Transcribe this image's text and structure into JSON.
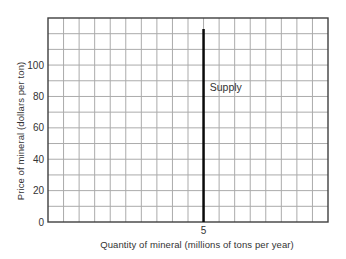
{
  "figure": {
    "background": "#ffffff"
  },
  "chart_data": {
    "type": "line",
    "title": "",
    "xlabel": "Quantity of mineral (millions of tons per year)",
    "ylabel": "Price of mineral (dollars per ton)",
    "xlim": [
      0,
      9
    ],
    "ylim": [
      0,
      130
    ],
    "x_grid_step": 0.5,
    "y_grid_step": 10,
    "grid": true,
    "legend_position": "none",
    "x_ticks": [
      {
        "value": 5,
        "label": "5"
      }
    ],
    "y_ticks": [
      {
        "value": 0,
        "label": "0"
      },
      {
        "value": 20,
        "label": "20"
      },
      {
        "value": 40,
        "label": "40"
      },
      {
        "value": 60,
        "label": "60"
      },
      {
        "value": 80,
        "label": "80"
      },
      {
        "value": 100,
        "label": "100"
      }
    ],
    "series": [
      {
        "name": "Supply",
        "shape": "vertical-line",
        "x": [
          5,
          5
        ],
        "y": [
          0,
          123
        ],
        "color": "#0a0a0a",
        "stroke_width": 2.5,
        "annotation": {
          "text": "Supply",
          "x": 5.2,
          "y": 86,
          "anchor": "start",
          "font_size": 10.5
        }
      }
    ],
    "colors": {
      "grid": "#ababab",
      "frame": "#3f3f3f",
      "text": "#333333"
    }
  }
}
